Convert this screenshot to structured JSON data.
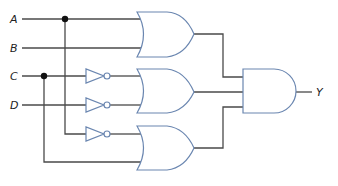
{
  "diagram": {
    "type": "logic-circuit",
    "inputs": [
      {
        "label": "A",
        "y": 19
      },
      {
        "label": "B",
        "y": 48
      },
      {
        "label": "C",
        "y": 76
      },
      {
        "label": "D",
        "y": 105
      }
    ],
    "output": {
      "label": "Y"
    },
    "gates": [
      {
        "id": "or1",
        "type": "OR",
        "inputs": [
          "A",
          "B"
        ]
      },
      {
        "id": "not1",
        "type": "NOT",
        "inputs": [
          "C"
        ]
      },
      {
        "id": "not2",
        "type": "NOT",
        "inputs": [
          "D"
        ]
      },
      {
        "id": "or2",
        "type": "OR",
        "inputs": [
          "not1",
          "not2"
        ]
      },
      {
        "id": "not3",
        "type": "NOT",
        "inputs": [
          "A"
        ]
      },
      {
        "id": "or3",
        "type": "OR",
        "inputs": [
          "not3",
          "C"
        ]
      },
      {
        "id": "and1",
        "type": "AND",
        "inputs": [
          "or1",
          "or2",
          "or3"
        ],
        "output": "Y"
      }
    ],
    "colors": {
      "gate_stroke": "#6a86b0",
      "wire": "#4a4a4a",
      "junction": "#111111"
    }
  }
}
